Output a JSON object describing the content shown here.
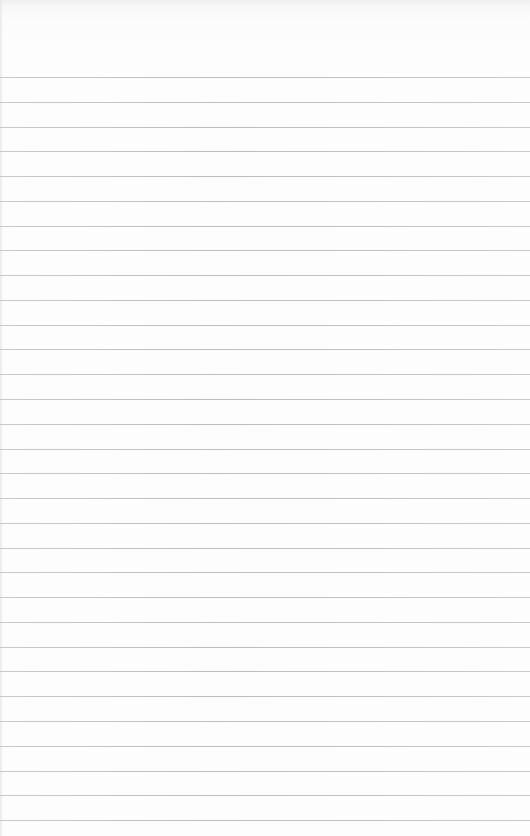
{
  "paper": {
    "type": "lined-notepad",
    "line_count": 31,
    "first_line_y": 77,
    "line_spacing": 24.77,
    "line_color": "#c2c2c2",
    "background_color": "#fdfdfd"
  }
}
